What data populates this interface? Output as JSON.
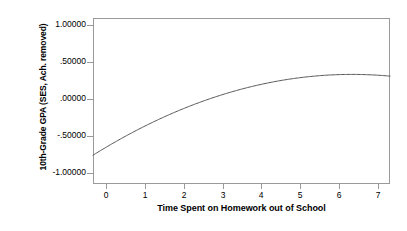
{
  "chart_data": {
    "type": "line",
    "title": "",
    "xlabel": "Time Spent on Homework out of School",
    "ylabel": "10th-Grade GPA (SES, Ach. removed)",
    "xlim": [
      -0.35,
      7.35
    ],
    "ylim": [
      -1.15,
      1.12
    ],
    "grid": false,
    "legend": null,
    "xticks": [
      0,
      1,
      2,
      3,
      4,
      5,
      6,
      7
    ],
    "xticklabels": [
      "0",
      "1",
      "2",
      "3",
      "4",
      "5",
      "6",
      "7"
    ],
    "yticks": [
      1.0,
      0.5,
      0.0,
      -0.5,
      -1.0
    ],
    "yticklabels": [
      "1.00000",
      ".50000",
      ".00000",
      "-.50000",
      "-1.00000"
    ],
    "series": [
      {
        "name": "Quadratic fit",
        "color": "#555555",
        "x": [
          -0.35,
          0.0,
          0.5,
          1.0,
          1.5,
          2.0,
          2.5,
          3.0,
          3.5,
          4.0,
          4.5,
          5.0,
          5.3,
          5.5,
          6.0,
          6.5,
          7.0,
          7.35
        ],
        "y": [
          -0.7,
          -0.62,
          -0.5,
          -0.38,
          -0.27,
          -0.16,
          -0.06,
          0.04,
          0.13,
          0.21,
          0.28,
          0.35,
          0.385,
          0.39,
          0.38,
          0.35,
          0.3,
          0.26
        ]
      }
    ],
    "annotations": [],
    "vertex": {
      "x": 5.35,
      "y": 0.39
    }
  },
  "axes": {
    "y_title": "10th-Grade GPA (SES, Ach. removed)",
    "x_title": "Time Spent on Homework out of School"
  }
}
